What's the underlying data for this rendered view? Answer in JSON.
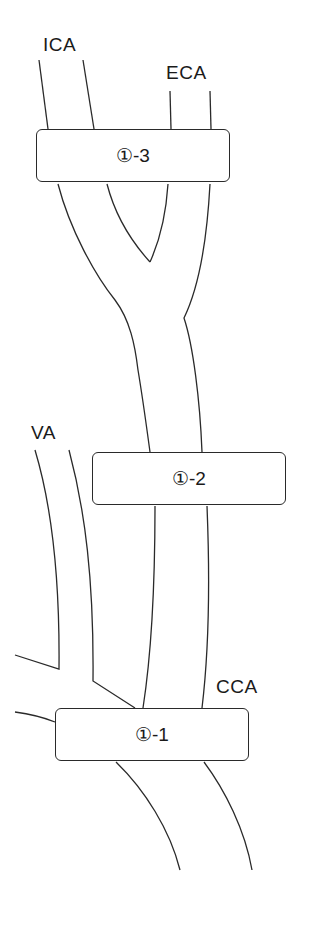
{
  "labels": {
    "ica": "ICA",
    "eca": "ECA",
    "va": "VA",
    "cca": "CCA"
  },
  "boxes": [
    {
      "id": "box-1-1",
      "text": "①-1"
    },
    {
      "id": "box-1-2",
      "text": "①-2"
    },
    {
      "id": "box-1-3",
      "text": "①-3"
    }
  ],
  "colors": {
    "line": "#2a2a2a",
    "background": "#ffffff"
  }
}
